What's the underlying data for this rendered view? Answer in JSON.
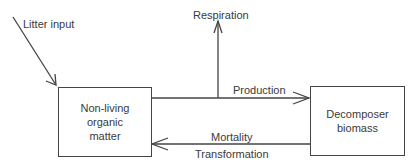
{
  "diagram": {
    "nodes": [
      {
        "id": "non_living",
        "label": "Non-living\norganic\nmatter"
      },
      {
        "id": "decomposer",
        "label": "Decomposer\nbiomass"
      }
    ],
    "edges": [
      {
        "id": "litter",
        "label": "Litter input",
        "from": "external",
        "to": "non_living"
      },
      {
        "id": "respiration",
        "label": "Respiration",
        "from": "production_flow",
        "to": "external"
      },
      {
        "id": "production",
        "label": "Production",
        "from": "non_living",
        "to": "decomposer"
      },
      {
        "id": "mortality",
        "label": "Mortality",
        "from": "decomposer",
        "to": "non_living"
      },
      {
        "id": "transformation",
        "label": "Transformation",
        "from": "decomposer",
        "to": "non_living"
      }
    ],
    "colors": {
      "line": "#444444",
      "text": "#3a3a3a",
      "background": "#ffffff"
    }
  }
}
